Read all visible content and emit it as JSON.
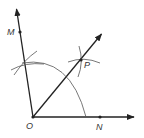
{
  "diagram": {
    "colors": {
      "line": "#222222",
      "arc": "#444444",
      "label": "#333333"
    },
    "points": {
      "O": {
        "label": "O",
        "x": 33,
        "y": 117,
        "label_x": 26,
        "label_y": 122
      },
      "M": {
        "label": "M",
        "x": 20,
        "y": 32,
        "label_x": 7,
        "label_y": 28
      },
      "N": {
        "label": "N",
        "x": 100,
        "y": 117,
        "label_x": 96,
        "label_y": 123
      },
      "P": {
        "label": "P",
        "x": 81,
        "y": 60,
        "label_x": 84,
        "label_y": 61
      }
    },
    "rays": [
      {
        "name": "ray-OM",
        "from": "O",
        "to": [
          16,
          7
        ]
      },
      {
        "name": "ray-ON",
        "from": "O",
        "to": [
          136,
          117
        ]
      },
      {
        "name": "ray-OP",
        "from": "O",
        "to": [
          103,
          32
        ]
      }
    ]
  }
}
